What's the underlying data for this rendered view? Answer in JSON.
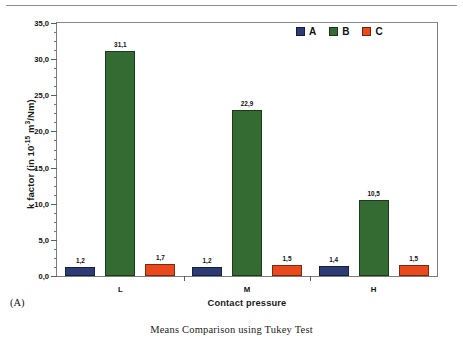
{
  "page": {
    "panel_label": "(A)",
    "caption": "Means Comparison using Tukey Test"
  },
  "chart_data": {
    "type": "bar",
    "title": "",
    "subtitle": "",
    "xlabel": "Contact pressure",
    "ylabel": "k factor (in 10-15 m3/Nm)",
    "ylabel_parts": {
      "prefix": "k factor (in 10",
      "exp1": "-15",
      "mid": " m",
      "exp2": "3",
      "suffix": "/Nm)"
    },
    "categories": [
      "L",
      "M",
      "H"
    ],
    "series": [
      {
        "name": "A",
        "color": "#2c3b75",
        "values": [
          1.2,
          1.2,
          1.4
        ],
        "labels": [
          "1,2",
          "1,2",
          "1,4"
        ]
      },
      {
        "name": "B",
        "color": "#346b33",
        "values": [
          31.1,
          22.9,
          10.5
        ],
        "labels": [
          "31,1",
          "22,9",
          "10,5"
        ]
      },
      {
        "name": "C",
        "color": "#e8491d",
        "values": [
          1.7,
          1.5,
          1.5
        ],
        "labels": [
          "1,7",
          "1,5",
          "1,5"
        ]
      }
    ],
    "ylim": [
      0,
      35
    ],
    "ytick_step": 5,
    "yminor_step": 1.25,
    "ytick_labels": [
      "0,0",
      "5,0",
      "10,0",
      "15,0",
      "20,0",
      "25,0",
      "30,0",
      "35,0"
    ],
    "ytick_values": [
      0,
      5,
      10,
      15,
      20,
      25,
      30,
      35
    ],
    "grid": false,
    "legend_position": "top-right",
    "decimal_separator": ","
  }
}
